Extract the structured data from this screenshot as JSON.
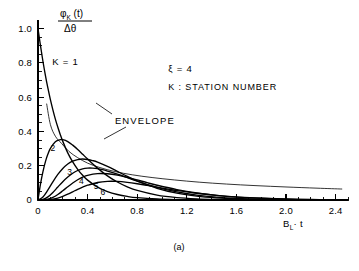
{
  "figure": {
    "caption": "(a)",
    "background_color": "#ffffff",
    "line_color": "#000000"
  },
  "chart_data": {
    "type": "line",
    "title": "",
    "subtitle": "",
    "xlabel": "B_L · t",
    "xlabel_parts": {
      "lead": "B",
      "sub": "L",
      "tail": "· t"
    },
    "ylabel": "φ_K(t) / Δθ",
    "ylabel_parts": {
      "num_lead": "φ",
      "num_sub": "K",
      "num_tail": "(t)",
      "den": "Δθ"
    },
    "xlim": [
      0,
      2.5
    ],
    "ylim": [
      0,
      1.05
    ],
    "xticks": [
      0,
      0.4,
      0.8,
      1.2,
      1.6,
      2.0,
      2.4
    ],
    "xtick_labels": [
      "0",
      "0.4",
      "0.8",
      "1.2",
      "1.6",
      "2.0",
      "2.4"
    ],
    "xtick_minor_step": 0.1,
    "yticks": [
      0,
      0.2,
      0.4,
      0.6,
      0.8,
      1.0
    ],
    "ytick_labels": [
      "0",
      "0.2",
      "0.4",
      "0.6",
      "0.8",
      "1.0"
    ],
    "ytick_minor_step": 0.05,
    "grid": false,
    "legend_position": "none",
    "annotations": [
      {
        "name": "xi-value",
        "text": "ξ  =  4",
        "x": 1.05,
        "y": 0.745
      },
      {
        "name": "station-number-key",
        "text": "K :  STATION  NUMBER",
        "x": 1.05,
        "y": 0.64
      },
      {
        "name": "k-one-label",
        "text": "K = 1",
        "x": 0.115,
        "y": 0.79
      },
      {
        "name": "envelope-label",
        "text": "ENVELOPE",
        "x": 0.62,
        "y": 0.445
      }
    ],
    "curve_labels": [
      {
        "name": "curve-label-2",
        "text": "2",
        "x": 0.1,
        "y": 0.285
      },
      {
        "name": "curve-label-3",
        "text": "3",
        "x": 0.235,
        "y": 0.145
      },
      {
        "name": "curve-label-4",
        "text": "4",
        "x": 0.33,
        "y": 0.095
      },
      {
        "name": "curve-label-5",
        "text": "5",
        "x": 0.45,
        "y": 0.062
      },
      {
        "name": "curve-label-6",
        "text": "6",
        "x": 0.505,
        "y": 0.028
      }
    ],
    "series": [
      {
        "name": "K = 1",
        "K": 1,
        "x": [
          0.0,
          0.02,
          0.04,
          0.06,
          0.08,
          0.1,
          0.12,
          0.14,
          0.16,
          0.18,
          0.2,
          0.24,
          0.28,
          0.32,
          0.36,
          0.4,
          0.48,
          0.56,
          0.64,
          0.72,
          0.8,
          0.96,
          1.12,
          1.28,
          1.44,
          1.6,
          1.8,
          2.0,
          2.2,
          2.4,
          2.5
        ],
        "values": [
          1.0,
          0.9,
          0.808,
          0.726,
          0.652,
          0.585,
          0.526,
          0.472,
          0.424,
          0.381,
          0.342,
          0.275,
          0.222,
          0.179,
          0.144,
          0.116,
          0.0754,
          0.0491,
          0.032,
          0.0208,
          0.0135,
          0.00573,
          0.00242,
          0.00103,
          0.00043,
          0.00018,
          5e-05,
          2e-05,
          0.0,
          0.0,
          0.0
        ]
      },
      {
        "name": "K = 2",
        "K": 2,
        "x": [
          0.0,
          0.02,
          0.04,
          0.06,
          0.08,
          0.1,
          0.14,
          0.18,
          0.2,
          0.24,
          0.28,
          0.32,
          0.36,
          0.4,
          0.48,
          0.56,
          0.64,
          0.72,
          0.8,
          0.96,
          1.12,
          1.28,
          1.44,
          1.6,
          1.8,
          2.0,
          2.2,
          2.4,
          2.5
        ],
        "values": [
          0.0,
          0.093,
          0.166,
          0.224,
          0.268,
          0.301,
          0.34,
          0.352,
          0.352,
          0.341,
          0.32,
          0.295,
          0.267,
          0.239,
          0.186,
          0.141,
          0.105,
          0.0768,
          0.0556,
          0.0283,
          0.0139,
          0.00666,
          0.00313,
          0.00145,
          0.0005,
          0.00017,
          6e-05,
          2e-05,
          0.0
        ]
      },
      {
        "name": "K = 3",
        "K": 3,
        "x": [
          0.0,
          0.04,
          0.08,
          0.12,
          0.16,
          0.2,
          0.24,
          0.28,
          0.32,
          0.36,
          0.4,
          0.44,
          0.48,
          0.56,
          0.64,
          0.72,
          0.8,
          0.96,
          1.12,
          1.28,
          1.44,
          1.6,
          1.8,
          2.0,
          2.2,
          2.4,
          2.5
        ],
        "values": [
          0.0,
          0.018,
          0.059,
          0.106,
          0.149,
          0.184,
          0.21,
          0.227,
          0.236,
          0.239,
          0.236,
          0.23,
          0.221,
          0.196,
          0.167,
          0.138,
          0.111,
          0.0683,
          0.0398,
          0.0223,
          0.0121,
          0.00642,
          0.00256,
          0.00098,
          0.00037,
          0.00013,
          8e-05
        ]
      },
      {
        "name": "K = 4",
        "K": 4,
        "x": [
          0.0,
          0.04,
          0.08,
          0.12,
          0.16,
          0.2,
          0.24,
          0.28,
          0.32,
          0.36,
          0.4,
          0.44,
          0.48,
          0.52,
          0.56,
          0.64,
          0.72,
          0.8,
          0.96,
          1.12,
          1.28,
          1.44,
          1.6,
          1.8,
          2.0,
          2.2,
          2.4,
          2.5
        ],
        "values": [
          0.0,
          0.003,
          0.018,
          0.044,
          0.076,
          0.107,
          0.134,
          0.156,
          0.172,
          0.182,
          0.186,
          0.186,
          0.183,
          0.177,
          0.169,
          0.151,
          0.131,
          0.11,
          0.0738,
          0.047,
          0.0287,
          0.017,
          0.00976,
          0.00438,
          0.00188,
          0.00078,
          0.00031,
          0.00019
        ]
      },
      {
        "name": "K = 5",
        "K": 5,
        "x": [
          0.0,
          0.04,
          0.08,
          0.12,
          0.16,
          0.2,
          0.24,
          0.28,
          0.32,
          0.36,
          0.4,
          0.48,
          0.56,
          0.64,
          0.72,
          0.8,
          0.88,
          0.96,
          1.12,
          1.28,
          1.44,
          1.6,
          1.8,
          2.0,
          2.2,
          2.4,
          2.5
        ],
        "values": [
          0.0,
          0.001,
          0.005,
          0.015,
          0.032,
          0.054,
          0.077,
          0.099,
          0.118,
          0.133,
          0.144,
          0.154,
          0.153,
          0.145,
          0.132,
          0.117,
          0.101,
          0.0862,
          0.0608,
          0.041,
          0.0266,
          0.0167,
          0.01018,
          0.00496,
          0.00231,
          0.00104,
          0.00069
        ]
      },
      {
        "name": "K = 6",
        "K": 6,
        "x": [
          0.0,
          0.04,
          0.08,
          0.12,
          0.16,
          0.2,
          0.24,
          0.28,
          0.32,
          0.36,
          0.4,
          0.48,
          0.56,
          0.64,
          0.72,
          0.8,
          0.88,
          0.96,
          1.04,
          1.12,
          1.28,
          1.44,
          1.6,
          1.8,
          2.0,
          2.2,
          2.4,
          2.5
        ],
        "values": [
          0.0,
          0.0002,
          0.0013,
          0.0045,
          0.011,
          0.0212,
          0.034,
          0.048,
          0.062,
          0.075,
          0.0862,
          0.1022,
          0.109,
          0.1086,
          0.1032,
          0.095,
          0.0852,
          0.0749,
          0.0649,
          0.0555,
          0.0395,
          0.0271,
          0.0179,
          0.01127,
          0.00567,
          0.00275,
          0.00129,
          0.00087
        ]
      }
    ],
    "envelope": {
      "name": "ENVELOPE",
      "x": [
        0.07,
        0.1,
        0.14,
        0.19,
        0.25,
        0.32,
        0.4,
        0.5,
        0.62,
        0.76,
        0.92,
        1.1,
        1.3,
        1.52,
        1.75,
        2.0,
        2.25,
        2.45
      ],
      "values": [
        0.56,
        0.44,
        0.372,
        0.33,
        0.283,
        0.247,
        0.215,
        0.189,
        0.166,
        0.147,
        0.131,
        0.117,
        0.104,
        0.093,
        0.084,
        0.076,
        0.069,
        0.064
      ]
    }
  }
}
